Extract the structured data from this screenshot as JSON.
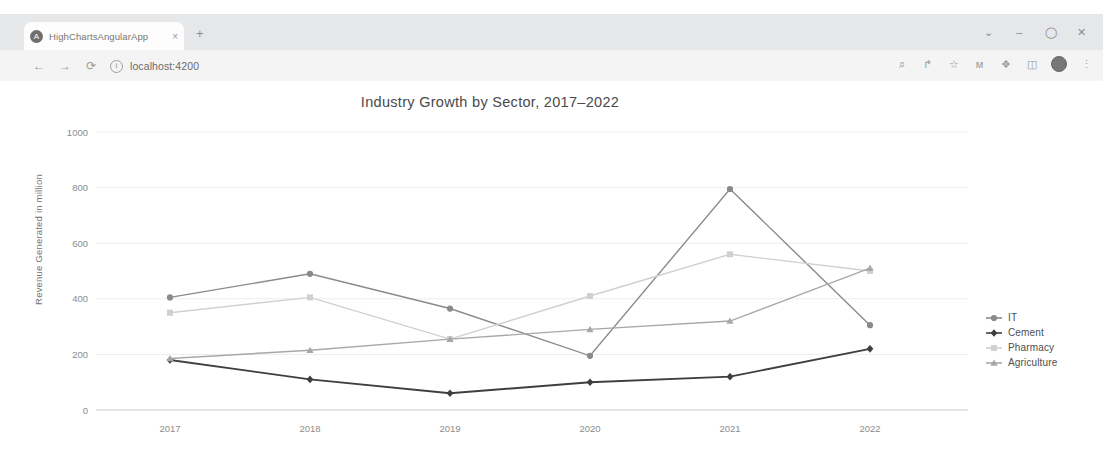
{
  "browser": {
    "tab": {
      "title": "HighChartsAngularApp",
      "close_label": "×",
      "favicon": "angular-logo-icon"
    },
    "new_tab_label": "+",
    "nav": {
      "back": "←",
      "forward": "→",
      "reload": "⟳"
    },
    "omnibox": {
      "url": "localhost:4200",
      "info_icon": "i"
    },
    "window_controls": {
      "minimize": "⌄",
      "restore": "–",
      "maximize": "⬜",
      "close": "✕"
    },
    "toolbar_icons": [
      {
        "name": "search-icon",
        "glyph": "⌕"
      },
      {
        "name": "share-icon",
        "glyph": "↱"
      },
      {
        "name": "bookmark-star-icon",
        "glyph": "☆"
      },
      {
        "name": "analytics-icon",
        "glyph": "ᴍ"
      },
      {
        "name": "extensions-puzzle-icon",
        "glyph": "❖"
      },
      {
        "name": "sidebar-icon",
        "glyph": "◫"
      },
      {
        "name": "profile-avatar",
        "glyph": ""
      },
      {
        "name": "overflow-menu-icon",
        "glyph": "⋮"
      }
    ]
  },
  "chart_data": {
    "type": "line",
    "title": "Industry Growth by Sector, 2017–2022",
    "xlabel": "",
    "ylabel": "Revenue Generated in million",
    "categories": [
      "2017",
      "2018",
      "2019",
      "2020",
      "2021",
      "2022"
    ],
    "ylim": [
      0,
      1000
    ],
    "yticks": [
      0,
      200,
      400,
      600,
      800,
      1000
    ],
    "grid": true,
    "legend_position": "right",
    "series": [
      {
        "name": "IT",
        "marker": "circle",
        "color": "#8a8a8a",
        "values": [
          405,
          490,
          365,
          195,
          795,
          305
        ]
      },
      {
        "name": "Cement",
        "marker": "diamond",
        "color": "#3f3f3f",
        "values": [
          180,
          110,
          60,
          100,
          120,
          220
        ]
      },
      {
        "name": "Pharmacy",
        "marker": "square",
        "color": "#d0d0d0",
        "values": [
          350,
          405,
          255,
          410,
          560,
          500
        ]
      },
      {
        "name": "Agriculture",
        "marker": "triangle",
        "color": "#a8a8a8",
        "values": [
          185,
          215,
          255,
          290,
          320,
          510
        ]
      }
    ]
  }
}
